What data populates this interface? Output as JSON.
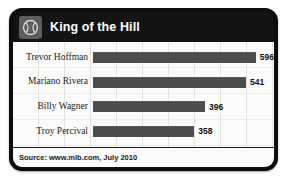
{
  "card": {
    "header": {
      "logo_icon": "baseball-icon",
      "title": "King of the Hill"
    },
    "footer": {
      "source_text": "Source: www.mlb.com, July 2010"
    }
  },
  "chart_data": {
    "type": "bar",
    "orientation": "horizontal",
    "title": "King of the Hill",
    "xlabel": "",
    "ylabel": "",
    "categories": [
      "Trevor Hoffman",
      "Mariano Rivera",
      "Billy Wagner",
      "Troy Percival"
    ],
    "values": [
      596,
      541,
      396,
      358
    ],
    "value_labels": [
      "596",
      "541",
      "396",
      "358"
    ],
    "xlim": [
      0,
      640
    ],
    "grid": true,
    "legend": null,
    "bar_color": "#4c4c4c",
    "plot_background": "#fbfbfa",
    "header_background": "#131313",
    "accent_color": "#5d5d5d",
    "source": "Source: www.mlb.com, July 2010"
  }
}
